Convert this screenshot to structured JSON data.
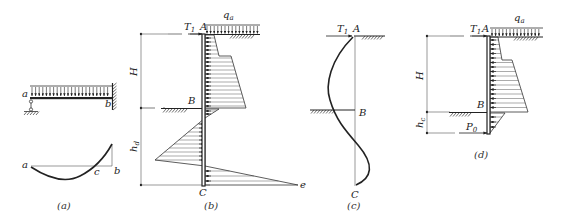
{
  "figure": {
    "panels": [
      {
        "id": "a",
        "caption": "(a)",
        "labels": {
          "left_end": "a",
          "right_end": "b",
          "zero_point": "c",
          "beam_left": "a",
          "beam_right": "b"
        },
        "description": "Equivalent beam with uniform load, pin support at a and fixed support at b; bending moment curve a-c-b"
      },
      {
        "id": "b",
        "caption": "(b)",
        "labels": {
          "top": "A",
          "excavation": "B",
          "toe": "C",
          "peak": "e",
          "anchor_force": "T",
          "anchor_sub": "1",
          "surcharge": "q",
          "surcharge_sub": "a",
          "height": "H",
          "embed": "h",
          "embed_sub": "d"
        },
        "description": "Earth pressure distribution on sheet pile wall"
      },
      {
        "id": "c",
        "caption": "(c)",
        "labels": {
          "top": "A",
          "mid": "B",
          "toe": "C",
          "anchor_force": "T",
          "anchor_sub": "1"
        },
        "description": "Deflected shape of sheet pile"
      },
      {
        "id": "d",
        "caption": "(d)",
        "labels": {
          "top": "A",
          "excavation": "B",
          "anchor_force": "T",
          "anchor_sub": "1",
          "surcharge": "q",
          "surcharge_sub": "a",
          "height": "H",
          "embed": "h",
          "embed_sub": "c",
          "reaction": "P",
          "reaction_sub": "0"
        },
        "description": "Simplified pressure diagram with reaction P0 at depth hc"
      }
    ]
  }
}
